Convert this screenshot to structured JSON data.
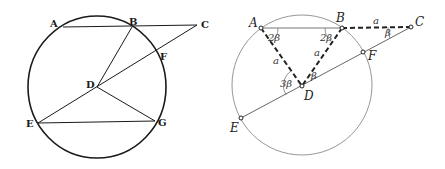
{
  "left_figure": {
    "style": "classical engraving",
    "points": {
      "A": {
        "label": "A"
      },
      "B": {
        "label": "B"
      },
      "C": {
        "label": "C"
      },
      "D": {
        "label": "D"
      },
      "E": {
        "label": "E"
      },
      "F": {
        "label": "F"
      },
      "G": {
        "label": "G"
      }
    },
    "segments": [
      "AC",
      "BD",
      "CE",
      "DG",
      "EG"
    ],
    "circle_center": "D"
  },
  "right_figure": {
    "style": "modern annotated",
    "points": {
      "A": {
        "label": "A"
      },
      "B": {
        "label": "B"
      },
      "C": {
        "label": "C"
      },
      "D": {
        "label": "D"
      },
      "E": {
        "label": "E"
      },
      "F": {
        "label": "F"
      }
    },
    "segment_labels": {
      "BC": "a",
      "AD": "a",
      "BD": "a"
    },
    "angle_labels": {
      "DAB": "2β",
      "ABD": "2β",
      "BCD": "β",
      "BDC": "β",
      "ADE": "3β"
    },
    "dashed_segments": [
      "AD",
      "BD",
      "BC"
    ],
    "solid_segments": [
      "AB",
      "CE"
    ],
    "colors": {
      "circle": "#888888",
      "lines": "#555555",
      "dashed": "#222222"
    }
  }
}
